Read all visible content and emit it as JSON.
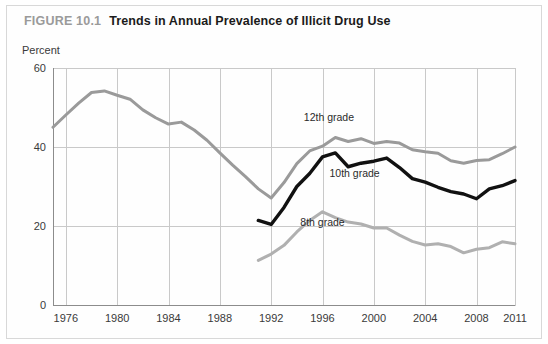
{
  "figure": {
    "number": "FIGURE 10.1",
    "title": "Trends in Annual Prevalence of Illicit Drug Use"
  },
  "chart_data": {
    "type": "line",
    "title": "Trends in Annual Prevalence of Illicit Drug Use",
    "xlabel": "",
    "ylabel": "Percent",
    "xlim": [
      1975,
      2011
    ],
    "ylim": [
      0,
      60
    ],
    "ytick_labels": [
      "0",
      "20",
      "40",
      "60"
    ],
    "yticks": [
      0,
      20,
      40,
      60
    ],
    "xtick_labels": [
      "1976",
      "1980",
      "1984",
      "1988",
      "1992",
      "1996",
      "2000",
      "2004",
      "2008",
      "2011"
    ],
    "xticks": [
      1976,
      1980,
      1984,
      1988,
      1992,
      1996,
      2000,
      2004,
      2008,
      2011
    ],
    "grid": true,
    "legend_position": "inline-labels",
    "series": [
      {
        "name": "12th grade",
        "color": "#9a9a9a",
        "label_x": 1996.5,
        "label_y": 46.5,
        "x": [
          1975,
          1976,
          1977,
          1978,
          1979,
          1980,
          1981,
          1982,
          1983,
          1984,
          1985,
          1986,
          1987,
          1988,
          1989,
          1990,
          1991,
          1992,
          1993,
          1994,
          1995,
          1996,
          1997,
          1998,
          1999,
          2000,
          2001,
          2002,
          2003,
          2004,
          2005,
          2006,
          2007,
          2008,
          2009,
          2010,
          2011
        ],
        "values": [
          45.0,
          48.1,
          51.1,
          53.8,
          54.2,
          53.1,
          52.1,
          49.4,
          47.4,
          45.8,
          46.3,
          44.3,
          41.7,
          38.5,
          35.4,
          32.5,
          29.4,
          27.1,
          31.0,
          35.8,
          39.0,
          40.2,
          42.4,
          41.4,
          42.1,
          40.9,
          41.4,
          41.0,
          39.3,
          38.8,
          38.4,
          36.5,
          35.9,
          36.6,
          36.8,
          38.3,
          40.0
        ]
      },
      {
        "name": "10th grade",
        "color": "#111111",
        "label_x": 1998.5,
        "label_y": 32.5,
        "x": [
          1991,
          1992,
          1993,
          1994,
          1995,
          1996,
          1997,
          1998,
          1999,
          2000,
          2001,
          2002,
          2003,
          2004,
          2005,
          2006,
          2007,
          2008,
          2009,
          2010,
          2011
        ],
        "values": [
          21.4,
          20.4,
          24.7,
          30.0,
          33.3,
          37.5,
          38.5,
          35.0,
          35.9,
          36.4,
          37.2,
          34.8,
          32.0,
          31.1,
          29.8,
          28.7,
          28.1,
          26.9,
          29.4,
          30.2,
          31.5
        ]
      },
      {
        "name": "8th grade",
        "color": "#b0b0b0",
        "label_x": 1996.0,
        "label_y": 20.0,
        "x": [
          1991,
          1992,
          1993,
          1994,
          1995,
          1996,
          1997,
          1998,
          1999,
          2000,
          2001,
          2002,
          2003,
          2004,
          2005,
          2006,
          2007,
          2008,
          2009,
          2010,
          2011
        ],
        "values": [
          11.3,
          12.9,
          15.1,
          18.5,
          21.4,
          23.6,
          22.1,
          21.0,
          20.5,
          19.5,
          19.5,
          17.7,
          16.1,
          15.2,
          15.5,
          14.8,
          13.2,
          14.1,
          14.5,
          16.0,
          15.5
        ]
      }
    ]
  }
}
